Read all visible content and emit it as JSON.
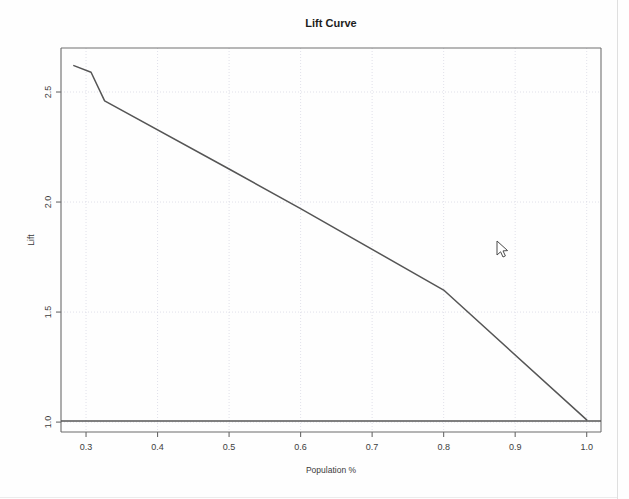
{
  "window": {
    "background_color": "#fefefe"
  },
  "chart_data": {
    "type": "line",
    "title": "Lift Curve",
    "xlabel": "Population %",
    "ylabel": "Lift",
    "grid": true,
    "legend": "none",
    "xlim": [
      0.265,
      1.02
    ],
    "ylim": [
      0.955,
      2.7
    ],
    "xticks": [
      0.3,
      0.4,
      0.5,
      0.6,
      0.7,
      0.8,
      0.9,
      1.0
    ],
    "xtick_labels": [
      "0.3",
      "0.4",
      "0.5",
      "0.6",
      "0.7",
      "0.8",
      "0.9",
      "1.0"
    ],
    "yticks": [
      1.0,
      1.5,
      2.0,
      2.5
    ],
    "ytick_labels": [
      "1.0",
      "1.5",
      "2.0",
      "2.5"
    ],
    "series": [
      {
        "name": "lift",
        "color": "#555555",
        "x": [
          0.283,
          0.307,
          0.326,
          0.5,
          0.6,
          0.8,
          1.0
        ],
        "y": [
          2.62,
          2.59,
          2.46,
          2.15,
          1.97,
          1.6,
          1.01
        ]
      },
      {
        "name": "baseline",
        "color": "#555555",
        "x": [
          0.265,
          1.02
        ],
        "y": [
          1.005,
          1.005
        ]
      }
    ]
  },
  "cursor": {
    "name": "mouse-pointer",
    "x": 497,
    "y": 241
  },
  "colors": {
    "axis": "#6a6a6a",
    "grid": "#d9d9e4",
    "series": "#555555",
    "text": "#333333"
  }
}
